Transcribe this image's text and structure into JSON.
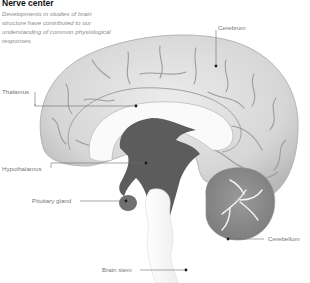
{
  "header": {
    "title": "Nerve center",
    "subtitle": "Developments in studies of brain structure have contributed to our understanding of common physiological responses."
  },
  "labels": {
    "cerebrum": "Cerebrum",
    "thalamus": "Thalamus",
    "hypothalamus": "Hypothalamus",
    "pituitary": "Pituitary gland",
    "cerebellum": "Cerebellum",
    "brain_stem": "Brain stem"
  },
  "colors": {
    "cerebrum": "#d9d9d9",
    "dark_core": "#5c5c5c",
    "cerebellum": "#8f8f8f",
    "leader_line": "#6b6b6b",
    "label_text": "#777777"
  }
}
